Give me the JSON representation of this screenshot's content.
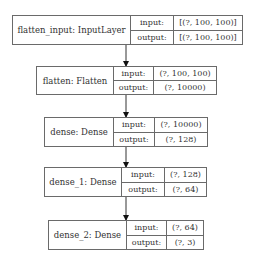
{
  "diagram": {
    "type": "keras-model-plot",
    "layers": [
      {
        "name": "flatten_input: InputLayer",
        "input_label": "input:",
        "output_label": "output:",
        "input": "[(?, 100, 100)]",
        "output": "[(?, 100, 100)]"
      },
      {
        "name": "flatten: Flatten",
        "input_label": "input:",
        "output_label": "output:",
        "input": "(?, 100, 100)",
        "output": "(?, 10000)"
      },
      {
        "name": "dense: Dense",
        "input_label": "input:",
        "output_label": "output:",
        "input": "(?, 10000)",
        "output": "(?, 128)"
      },
      {
        "name": "dense_1: Dense",
        "input_label": "input:",
        "output_label": "output:",
        "input": "(?, 128)",
        "output": "(?, 64)"
      },
      {
        "name": "dense_2: Dense",
        "input_label": "input:",
        "output_label": "output:",
        "input": "(?, 64)",
        "output": "(?, 3)"
      }
    ],
    "edges": [
      {
        "from": "flatten_input",
        "to": "flatten"
      },
      {
        "from": "flatten",
        "to": "dense"
      },
      {
        "from": "dense",
        "to": "dense_1"
      },
      {
        "from": "dense_1",
        "to": "dense_2"
      }
    ]
  },
  "colors": {
    "border": "#6a6a6a",
    "text": "#333333",
    "arrow": "#111111",
    "background": "#ffffff"
  }
}
